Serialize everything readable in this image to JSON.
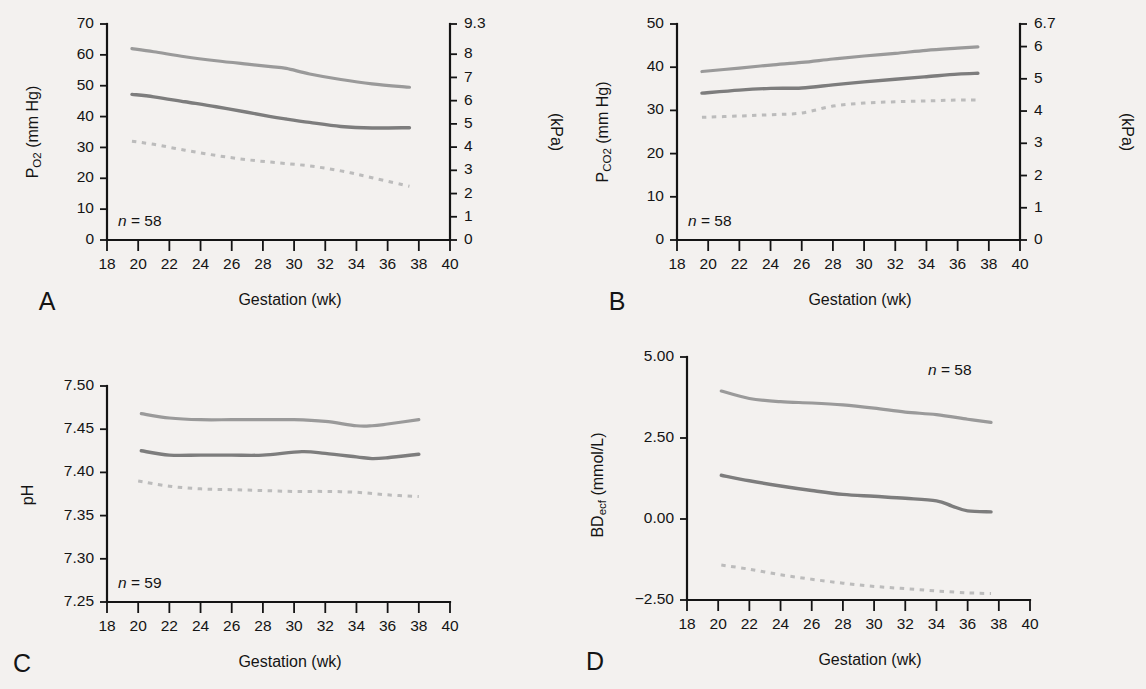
{
  "figure": {
    "background_color": "#f3f1ef",
    "ink_color": "#141414",
    "panel_count": 4
  },
  "colors": {
    "upper_curve": "#9a9a9a",
    "mid_curve": "#7d7d7d",
    "lower_curve_dotted": "#bcbcbc",
    "axis": "#141414"
  },
  "panels": {
    "A": {
      "letter": "A",
      "n_label_prefix": "n",
      "n_label_eq": " = ",
      "n_label_value": "58",
      "ylabel_main": "P",
      "ylabel_sub": "O",
      "ylabel_sub2": "2",
      "ylabel_unit": " (mm Hg)",
      "y2label": "(kPa)",
      "xlabel": "Gestation (wk)"
    },
    "B": {
      "letter": "B",
      "n_label_prefix": "n",
      "n_label_eq": " = ",
      "n_label_value": "58",
      "ylabel_main": "P",
      "ylabel_sub": "CO",
      "ylabel_sub2": "2",
      "ylabel_unit": " (mm Hg)",
      "y2label": "(kPa)",
      "xlabel": "Gestation (wk)"
    },
    "C": {
      "letter": "C",
      "n_label_prefix": "n",
      "n_label_eq": " = ",
      "n_label_value": "59",
      "ylabel_main": "pH",
      "xlabel": "Gestation (wk)"
    },
    "D": {
      "letter": "D",
      "n_label_prefix": "n",
      "n_label_eq": " = ",
      "n_label_value": "58",
      "ylabel_main": "BD",
      "ylabel_sub": "ecf",
      "ylabel_unit": " (mmol/L)",
      "xlabel": "Gestation (wk)"
    }
  },
  "chart_data": [
    {
      "panel": "A",
      "type": "line",
      "title": "",
      "xlabel": "Gestation (wk)",
      "ylabel": "PO2 (mm Hg)",
      "y2label": "(kPa)",
      "xlim": [
        18,
        40
      ],
      "ylim": [
        0,
        70
      ],
      "y2lim": [
        0,
        9.3
      ],
      "xticks": [
        18,
        20,
        22,
        24,
        26,
        28,
        30,
        32,
        34,
        36,
        38,
        40
      ],
      "xticklabels": [
        "18",
        "20",
        "22",
        "24",
        "26",
        "28",
        "30",
        "32",
        "34",
        "36",
        "38",
        "40"
      ],
      "yticks": [
        0,
        10,
        20,
        30,
        40,
        50,
        60,
        70
      ],
      "yticklabels": [
        "0",
        "10",
        "20",
        "30",
        "40",
        "50",
        "60",
        "70"
      ],
      "y2ticks": [
        0,
        1,
        2,
        3,
        4,
        5,
        6,
        7,
        8,
        9.3
      ],
      "y2ticklabels": [
        "0",
        "1",
        "2",
        "3",
        "4",
        "5",
        "6",
        "7",
        "8",
        "9.3"
      ],
      "grid": false,
      "legend": "none",
      "annotation": "n = 58",
      "series": [
        {
          "name": "upper centile",
          "style": "solid-light",
          "x": [
            19.6,
            21,
            23,
            25,
            27,
            28.5,
            29.5,
            31,
            33,
            35,
            37.4
          ],
          "values": [
            62.0,
            61.0,
            59.4,
            58.1,
            57.0,
            56.2,
            55.6,
            53.8,
            52.0,
            50.6,
            49.5
          ]
        },
        {
          "name": "median",
          "style": "solid-dark",
          "x": [
            19.6,
            21,
            23,
            25,
            27,
            28.5,
            29.5,
            31,
            33,
            35,
            37.4
          ],
          "values": [
            47.2,
            46.4,
            44.8,
            43.2,
            41.4,
            40.0,
            39.2,
            38.1,
            36.8,
            36.3,
            36.4
          ]
        },
        {
          "name": "lower centile",
          "style": "dotted",
          "x": [
            19.6,
            21,
            23,
            25,
            27,
            29,
            31,
            33,
            35,
            37.4
          ],
          "values": [
            32.0,
            31.0,
            29.1,
            27.4,
            26.0,
            25.0,
            24.0,
            22.4,
            20.2,
            17.4
          ]
        }
      ]
    },
    {
      "panel": "B",
      "type": "line",
      "title": "",
      "xlabel": "Gestation (wk)",
      "ylabel": "PCO2 (mm Hg)",
      "y2label": "(kPa)",
      "xlim": [
        18,
        40
      ],
      "ylim": [
        0,
        50
      ],
      "y2lim": [
        0,
        6.7
      ],
      "xticks": [
        18,
        20,
        22,
        24,
        26,
        28,
        30,
        32,
        34,
        36,
        38,
        40
      ],
      "xticklabels": [
        "18",
        "20",
        "22",
        "24",
        "26",
        "28",
        "30",
        "32",
        "34",
        "36",
        "38",
        "40"
      ],
      "yticks": [
        0,
        10,
        20,
        30,
        40,
        50
      ],
      "yticklabels": [
        "0",
        "10",
        "20",
        "30",
        "40",
        "50"
      ],
      "y2ticks": [
        0,
        1,
        2,
        3,
        4,
        5,
        6,
        6.7
      ],
      "y2ticklabels": [
        "0",
        "1",
        "2",
        "3",
        "4",
        "5",
        "6",
        "6.7"
      ],
      "grid": false,
      "legend": "none",
      "annotation": "n = 58",
      "series": [
        {
          "name": "upper centile",
          "style": "solid-light",
          "x": [
            19.6,
            22,
            24,
            26,
            28,
            30,
            32,
            34,
            36,
            37.3
          ],
          "values": [
            39.0,
            39.8,
            40.5,
            41.1,
            41.9,
            42.6,
            43.2,
            43.9,
            44.4,
            44.7
          ]
        },
        {
          "name": "median",
          "style": "solid-dark",
          "x": [
            19.6,
            22,
            24,
            26,
            28,
            30,
            32,
            34,
            36,
            37.3
          ],
          "values": [
            34.0,
            34.7,
            35.1,
            35.2,
            35.9,
            36.6,
            37.2,
            37.8,
            38.4,
            38.6
          ]
        },
        {
          "name": "lower centile",
          "style": "dotted",
          "x": [
            19.6,
            22,
            24,
            26,
            28,
            30,
            32,
            34,
            36,
            37.3
          ],
          "values": [
            28.4,
            28.7,
            29.0,
            29.4,
            31.0,
            31.7,
            32.0,
            32.2,
            32.4,
            32.4
          ]
        }
      ]
    },
    {
      "panel": "C",
      "type": "line",
      "title": "",
      "xlabel": "Gestation (wk)",
      "ylabel": "pH",
      "xlim": [
        18,
        40
      ],
      "ylim": [
        7.25,
        7.5
      ],
      "xticks": [
        18,
        20,
        22,
        24,
        26,
        28,
        30,
        32,
        34,
        36,
        38,
        40
      ],
      "xticklabels": [
        "18",
        "20",
        "22",
        "24",
        "26",
        "28",
        "30",
        "32",
        "34",
        "36",
        "38",
        "40"
      ],
      "yticks": [
        7.25,
        7.3,
        7.35,
        7.4,
        7.45,
        7.5
      ],
      "yticklabels": [
        "7.25",
        "7.30",
        "7.35",
        "7.40",
        "7.45",
        "7.50"
      ],
      "grid": false,
      "legend": "none",
      "annotation": "n = 59",
      "series": [
        {
          "name": "upper centile",
          "style": "solid-light",
          "x": [
            20.2,
            22,
            24,
            26,
            28,
            30,
            32,
            34,
            35,
            36,
            38
          ],
          "values": [
            7.468,
            7.463,
            7.461,
            7.461,
            7.461,
            7.461,
            7.459,
            7.454,
            7.454,
            7.456,
            7.461
          ]
        },
        {
          "name": "median",
          "style": "solid-dark",
          "x": [
            20.2,
            22,
            24,
            26,
            28,
            30.5,
            32,
            34,
            35,
            36,
            38
          ],
          "values": [
            7.425,
            7.42,
            7.42,
            7.42,
            7.42,
            7.424,
            7.422,
            7.418,
            7.416,
            7.417,
            7.421
          ]
        },
        {
          "name": "lower centile",
          "style": "dotted",
          "x": [
            20.0,
            22,
            24,
            26,
            28,
            30,
            32,
            34,
            36,
            38
          ],
          "values": [
            7.39,
            7.384,
            7.381,
            7.38,
            7.379,
            7.378,
            7.378,
            7.377,
            7.374,
            7.372
          ]
        }
      ]
    },
    {
      "panel": "D",
      "type": "line",
      "title": "",
      "xlabel": "Gestation (wk)",
      "ylabel": "BDecf (mmol/L)",
      "xlim": [
        18,
        40
      ],
      "ylim": [
        -2.5,
        5.0
      ],
      "xticks": [
        18,
        20,
        22,
        24,
        26,
        28,
        30,
        32,
        34,
        36,
        38,
        40
      ],
      "xticklabels": [
        "18",
        "20",
        "22",
        "24",
        "26",
        "28",
        "30",
        "32",
        "34",
        "36",
        "38",
        "40"
      ],
      "yticks": [
        -2.5,
        0.0,
        2.5,
        5.0
      ],
      "yticklabels": [
        "−2.50",
        "0.00",
        "2.50",
        "5.00"
      ],
      "grid": false,
      "legend": "none",
      "annotation": "n = 58",
      "series": [
        {
          "name": "upper centile",
          "style": "solid-light",
          "x": [
            20.2,
            22,
            24,
            26,
            28,
            30,
            32,
            34,
            36,
            37.5
          ],
          "values": [
            3.95,
            3.72,
            3.62,
            3.58,
            3.52,
            3.42,
            3.3,
            3.22,
            3.08,
            2.98
          ]
        },
        {
          "name": "median",
          "style": "solid-dark",
          "x": [
            20.2,
            22,
            24,
            26,
            28,
            30,
            32,
            34,
            35,
            36,
            37.5
          ],
          "values": [
            1.35,
            1.18,
            1.02,
            0.88,
            0.76,
            0.7,
            0.64,
            0.56,
            0.4,
            0.25,
            0.22
          ]
        },
        {
          "name": "lower centile",
          "style": "dotted",
          "x": [
            20.2,
            22,
            24,
            26,
            28,
            30,
            32,
            34,
            36,
            37.5
          ],
          "values": [
            -1.42,
            -1.55,
            -1.72,
            -1.86,
            -1.98,
            -2.08,
            -2.15,
            -2.22,
            -2.28,
            -2.3
          ]
        }
      ]
    }
  ]
}
